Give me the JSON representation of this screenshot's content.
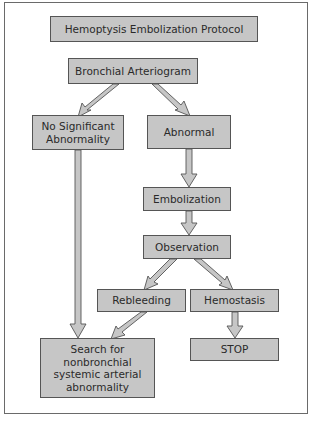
{
  "diagram": {
    "title": "Hemoptysis Embolization Protocol",
    "nodes": [
      {
        "id": "bronchial",
        "label": "Bronchial Arteriogram"
      },
      {
        "id": "no_abn",
        "label": "No Significant Abnormality"
      },
      {
        "id": "abnormal",
        "label": "Abnormal"
      },
      {
        "id": "embolization",
        "label": "Embolization"
      },
      {
        "id": "observation",
        "label": "Observation"
      },
      {
        "id": "rebleeding",
        "label": "Rebleeding"
      },
      {
        "id": "hemostasis",
        "label": "Hemostasis"
      },
      {
        "id": "stop",
        "label": "STOP"
      },
      {
        "id": "search",
        "label": "Search for nonbronchial systemic arterial abnormality"
      }
    ],
    "edges": [
      {
        "from": "bronchial",
        "to": "no_abn"
      },
      {
        "from": "bronchial",
        "to": "abnormal"
      },
      {
        "from": "no_abn",
        "to": "search"
      },
      {
        "from": "abnormal",
        "to": "embolization"
      },
      {
        "from": "embolization",
        "to": "observation"
      },
      {
        "from": "observation",
        "to": "rebleeding"
      },
      {
        "from": "observation",
        "to": "hemostasis"
      },
      {
        "from": "rebleeding",
        "to": "search"
      },
      {
        "from": "hemostasis",
        "to": "stop"
      }
    ],
    "colors": {
      "box_fill": "#c6c6c6",
      "arrow_fill": "#c6c6c6",
      "outline": "#555555",
      "text": "#2a2a2a"
    }
  }
}
